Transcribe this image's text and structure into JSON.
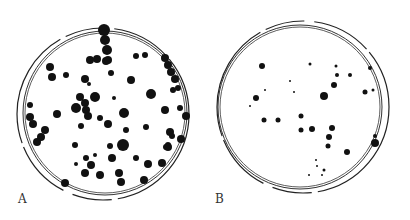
{
  "figure": {
    "panels": [
      {
        "label": "A",
        "dish": {
          "cx": 105,
          "cy": 113,
          "inner_r": 80,
          "outer_r": 86
        },
        "colonies": [
          [
            104,
            30,
            6
          ],
          [
            105,
            40,
            5
          ],
          [
            107,
            50,
            5
          ],
          [
            108,
            60,
            4
          ],
          [
            90,
            60,
            4
          ],
          [
            97,
            59,
            4
          ],
          [
            106,
            61,
            4
          ],
          [
            136,
            56,
            3
          ],
          [
            145,
            55,
            3
          ],
          [
            165,
            58,
            4
          ],
          [
            168,
            65,
            4
          ],
          [
            171,
            72,
            4
          ],
          [
            175,
            79,
            4
          ],
          [
            178,
            88,
            3
          ],
          [
            173,
            90,
            3
          ],
          [
            50,
            67,
            4
          ],
          [
            52,
            77,
            4
          ],
          [
            66,
            75,
            3
          ],
          [
            85,
            79,
            4
          ],
          [
            89,
            84,
            2
          ],
          [
            111,
            73,
            3
          ],
          [
            131,
            80,
            4
          ],
          [
            80,
            97,
            4
          ],
          [
            85,
            103,
            4
          ],
          [
            76,
            108,
            5
          ],
          [
            86,
            110,
            4
          ],
          [
            95,
            97,
            5
          ],
          [
            88,
            116,
            4
          ],
          [
            57,
            114,
            4
          ],
          [
            114,
            98,
            2
          ],
          [
            124,
            113,
            5
          ],
          [
            151,
            94,
            5
          ],
          [
            165,
            110,
            4
          ],
          [
            180,
            108,
            3
          ],
          [
            186,
            116,
            4
          ],
          [
            30,
            105,
            3
          ],
          [
            30,
            117,
            4
          ],
          [
            33,
            124,
            4
          ],
          [
            45,
            130,
            4
          ],
          [
            41,
            137,
            4
          ],
          [
            37,
            142,
            4
          ],
          [
            81,
            126,
            3
          ],
          [
            100,
            118,
            3
          ],
          [
            108,
            124,
            4
          ],
          [
            146,
            127,
            3
          ],
          [
            126,
            130,
            3
          ],
          [
            170,
            132,
            4
          ],
          [
            172,
            136,
            3
          ],
          [
            168,
            145,
            3
          ],
          [
            181,
            139,
            4
          ],
          [
            166,
            147,
            3
          ],
          [
            75,
            145,
            3
          ],
          [
            123,
            145,
            6
          ],
          [
            110,
            146,
            3
          ],
          [
            168,
            147,
            4
          ],
          [
            76,
            164,
            2
          ],
          [
            86,
            158,
            3
          ],
          [
            95,
            155,
            2
          ],
          [
            91,
            165,
            4
          ],
          [
            112,
            158,
            4
          ],
          [
            136,
            158,
            3
          ],
          [
            148,
            164,
            4
          ],
          [
            162,
            163,
            4
          ],
          [
            85,
            173,
            4
          ],
          [
            100,
            175,
            4
          ],
          [
            119,
            173,
            4
          ],
          [
            121,
            182,
            4
          ],
          [
            144,
            180,
            4
          ],
          [
            65,
            183,
            4
          ]
        ]
      },
      {
        "label": "B",
        "dish": {
          "cx": 300,
          "cy": 107,
          "inner_r": 80,
          "outer_r": 86
        },
        "colonies": [
          [
            262,
            66,
            3
          ],
          [
            310,
            64,
            1.5
          ],
          [
            336,
            66,
            1.5
          ],
          [
            337,
            75,
            2
          ],
          [
            350,
            75,
            2
          ],
          [
            334,
            85,
            3
          ],
          [
            324,
            96,
            4
          ],
          [
            365,
            92,
            2.5
          ],
          [
            256,
            98,
            3
          ],
          [
            265,
            90,
            1
          ],
          [
            294,
            92,
            1
          ],
          [
            290,
            81,
            1
          ],
          [
            250,
            106,
            1
          ],
          [
            264,
            120,
            2.5
          ],
          [
            278,
            120,
            2.5
          ],
          [
            301,
            116,
            2.5
          ],
          [
            312,
            129,
            3
          ],
          [
            332,
            128,
            3
          ],
          [
            329,
            137,
            3
          ],
          [
            301,
            130,
            2.5
          ],
          [
            328,
            146,
            2.5
          ],
          [
            347,
            152,
            3
          ],
          [
            316,
            160,
            1
          ],
          [
            317,
            166,
            1
          ],
          [
            324,
            170,
            1.5
          ],
          [
            322,
            175,
            1
          ],
          [
            309,
            175,
            1
          ],
          [
            370,
            68,
            2
          ],
          [
            373,
            90,
            1.5
          ],
          [
            375,
            136,
            2
          ],
          [
            375,
            143,
            4
          ]
        ]
      }
    ]
  }
}
